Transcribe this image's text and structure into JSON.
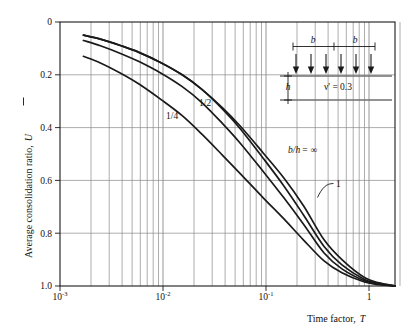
{
  "chart_data": {
    "type": "line",
    "title": "",
    "xlabel": "Time factor, T",
    "ylabel": "Average consolidation ratio, U̅",
    "xscale": "log",
    "xlim": [
      0.001,
      2.0
    ],
    "ylim": [
      0.0,
      1.0
    ],
    "y_inverted": true,
    "grid": true,
    "legend_position": "inline-annotations",
    "xticks_major": [
      "10⁻³",
      "10⁻²",
      "10⁻¹",
      "1"
    ],
    "xticks_major_values": [
      0.001,
      0.01,
      0.1,
      1
    ],
    "yticks": [
      "0",
      "0.2",
      "0.4",
      "0.6",
      "0.8",
      "1.0"
    ],
    "ytick_values": [
      0,
      0.2,
      0.4,
      0.6,
      0.8,
      1.0
    ],
    "series": [
      {
        "name": "1/4",
        "label": "1/4",
        "label_x": 0.0055,
        "label_y": 0.365,
        "x": [
          0.0017,
          0.0025,
          0.004,
          0.006,
          0.01,
          0.016,
          0.025,
          0.04,
          0.06,
          0.1,
          0.16,
          0.25,
          0.4,
          0.6,
          1.0,
          1.4,
          2.0
        ],
        "y": [
          0.13,
          0.155,
          0.195,
          0.235,
          0.295,
          0.355,
          0.425,
          0.505,
          0.575,
          0.665,
          0.745,
          0.825,
          0.905,
          0.95,
          0.985,
          0.995,
          1.0
        ]
      },
      {
        "name": "1/2",
        "label": "1/2",
        "label_x": 0.0175,
        "label_y": 0.315,
        "x": [
          0.0017,
          0.0025,
          0.004,
          0.006,
          0.01,
          0.016,
          0.025,
          0.04,
          0.06,
          0.1,
          0.16,
          0.25,
          0.4,
          0.6,
          1.0,
          1.4,
          2.0
        ],
        "y": [
          0.07,
          0.09,
          0.12,
          0.15,
          0.195,
          0.245,
          0.305,
          0.385,
          0.46,
          0.565,
          0.665,
          0.765,
          0.875,
          0.935,
          0.98,
          0.993,
          1.0
        ]
      },
      {
        "name": "1",
        "label": "1",
        "label_x": 0.45,
        "label_y": 0.64,
        "leader": true,
        "x": [
          0.0017,
          0.0025,
          0.004,
          0.006,
          0.01,
          0.016,
          0.025,
          0.04,
          0.06,
          0.1,
          0.16,
          0.25,
          0.4,
          0.6,
          1.0,
          1.4,
          2.0
        ],
        "y": [
          0.05,
          0.065,
          0.09,
          0.115,
          0.155,
          0.2,
          0.255,
          0.33,
          0.405,
          0.515,
          0.62,
          0.73,
          0.85,
          0.92,
          0.975,
          0.99,
          1.0
        ]
      },
      {
        "name": "b/h = ∞",
        "label": "b/h = ∞",
        "label_x": 0.125,
        "label_y": 0.485,
        "x": [
          0.0017,
          0.0025,
          0.004,
          0.006,
          0.01,
          0.016,
          0.025,
          0.04,
          0.06,
          0.1,
          0.16,
          0.25,
          0.4,
          0.6,
          1.0,
          1.4,
          2.0
        ],
        "y": [
          0.05,
          0.065,
          0.09,
          0.115,
          0.155,
          0.2,
          0.255,
          0.325,
          0.395,
          0.495,
          0.59,
          0.695,
          0.825,
          0.9,
          0.968,
          0.988,
          1.0
        ]
      }
    ],
    "annotations": [
      {
        "text": "1/4",
        "name": "curve-label-quarter"
      },
      {
        "text": "1/2",
        "name": "curve-label-half"
      },
      {
        "text": "b/h =",
        "name": "curve-label-bh-infinity"
      },
      {
        "text": "∞",
        "name": "infinity-symbol"
      },
      {
        "text": "1",
        "name": "curve-label-one"
      }
    ]
  },
  "axes": {
    "y_title_main": "Average consolidation ratio,",
    "y_title_symbol": "U",
    "x_title_main": "Time factor,",
    "x_title_symbol": "T",
    "ytick_0": "0",
    "ytick_1": "0.2",
    "ytick_2": "0.4",
    "ytick_3": "0.6",
    "ytick_4": "0.8",
    "ytick_5": "1.0",
    "xtick_0_base": "10",
    "xtick_0_exp": "-3",
    "xtick_1_base": "10",
    "xtick_1_exp": "-2",
    "xtick_2_base": "10",
    "xtick_2_exp": "-1",
    "xtick_3_base": "1"
  },
  "inset": {
    "name": "loading-diagram",
    "dim_left_label": "b",
    "dim_right_label": "b",
    "depth_label": "h",
    "poisson_label": "ν' = 0.3",
    "arrow_count": 6
  },
  "colors": {
    "curve": "#1a1a1a",
    "grid": "#8a8a8a",
    "axis": "#1a1a1a",
    "text": "#111111",
    "inset_line": "#6f6f6f",
    "inset_arrow": "#1a1a1a"
  }
}
